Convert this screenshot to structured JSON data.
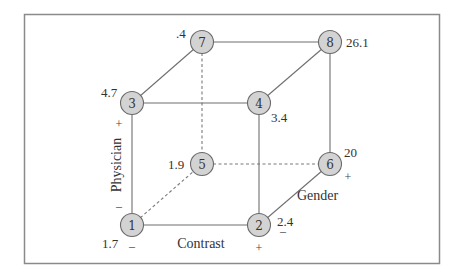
{
  "diagram": {
    "type": "cube-design-plot",
    "factors": {
      "contrast": {
        "label": "Contrast",
        "low": "–",
        "high": "+"
      },
      "physician": {
        "label": "Physician",
        "low": "–",
        "high": "+"
      },
      "gender": {
        "label": "Gender",
        "low": "–",
        "high": "+"
      }
    },
    "nodes": [
      {
        "id": "1",
        "value": "1.7"
      },
      {
        "id": "2",
        "value": "2.4"
      },
      {
        "id": "3",
        "value": "4.7"
      },
      {
        "id": "4",
        "value": "3.4"
      },
      {
        "id": "5",
        "value": "1.9"
      },
      {
        "id": "6",
        "value": "20"
      },
      {
        "id": "7",
        "value": ".4"
      },
      {
        "id": "8",
        "value": "26.1"
      }
    ],
    "colors": {
      "node_fill": "#d3d3d3",
      "node_stroke": "#6a6a6a",
      "edge": "#6f6f6f",
      "frame": "#8a8a8a"
    }
  }
}
